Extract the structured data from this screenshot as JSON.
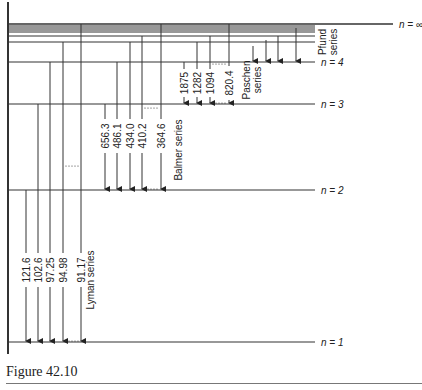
{
  "caption": "Figure 42.10",
  "colors": {
    "line": "#333333",
    "text": "#222222"
  },
  "axis": {
    "x": 8,
    "y_top": 2,
    "y_bottom": 354
  },
  "level_line_end_x": 315,
  "levels": [
    {
      "n": "1",
      "label": "n = 1",
      "y": 342,
      "labeled": true
    },
    {
      "n": "2",
      "label": "n = 2",
      "y": 190,
      "labeled": true
    },
    {
      "n": "3",
      "label": "n = 3",
      "y": 104,
      "labeled": true
    },
    {
      "n": "4",
      "label": "n = 4",
      "y": 62,
      "labeled": true
    },
    {
      "n": "5",
      "label": "",
      "y": 42,
      "labeled": false
    },
    {
      "n": "6",
      "label": "",
      "y": 36,
      "labeled": false
    },
    {
      "n": "7",
      "label": "",
      "y": 32,
      "labeled": false
    },
    {
      "n": "8",
      "label": "",
      "y": 30,
      "labeled": false
    },
    {
      "n": "9",
      "label": "",
      "y": 28,
      "labeled": false
    },
    {
      "n": "10",
      "label": "",
      "y": 26,
      "labeled": false
    },
    {
      "n": "∞",
      "label": "n = ∞",
      "y": 24,
      "labeled": true,
      "extends_to_x": 393
    }
  ],
  "series": [
    {
      "name": "Lyman series",
      "to_n": "1",
      "label": {
        "x": 90,
        "y": 280
      },
      "transitions": [
        {
          "from_n": "2",
          "x": 26,
          "wavelength": "121.6"
        },
        {
          "from_n": "3",
          "x": 38,
          "wavelength": "102.6"
        },
        {
          "from_n": "4",
          "x": 50,
          "wavelength": "97.25"
        },
        {
          "from_n": "5",
          "x": 63,
          "wavelength": "94.98"
        },
        {
          "from_n": "∞",
          "x": 81,
          "wavelength": "91.17"
        }
      ],
      "wavelength_label_y": 270,
      "dots_top_y": 166
    },
    {
      "name": "Balmer series",
      "to_n": "2",
      "label": {
        "x": 178,
        "y": 150
      },
      "transitions": [
        {
          "from_n": "3",
          "x": 105,
          "wavelength": "656.3"
        },
        {
          "from_n": "4",
          "x": 117,
          "wavelength": "486.1"
        },
        {
          "from_n": "5",
          "x": 130,
          "wavelength": "434.0"
        },
        {
          "from_n": "6",
          "x": 142,
          "wavelength": "410.2"
        },
        {
          "from_n": "∞",
          "x": 161,
          "wavelength": "364.6"
        }
      ],
      "wavelength_label_y": 136,
      "dots_top_y": 108
    },
    {
      "name": "Paschen series",
      "label_lines": [
        "Paschen",
        "series"
      ],
      "to_n": "3",
      "label": {
        "x": 246,
        "y": 80
      },
      "transitions": [
        {
          "from_n": "4",
          "x": 184,
          "wavelength": "1875"
        },
        {
          "from_n": "5",
          "x": 197,
          "wavelength": "1282"
        },
        {
          "from_n": "6",
          "x": 210,
          "wavelength": "1094"
        },
        {
          "from_n": "∞",
          "x": 229,
          "wavelength": "820.4"
        }
      ],
      "wavelength_label_y": 83,
      "dots_top_y": 64
    },
    {
      "name": "Pfund series",
      "label_lines": [
        "Pfund",
        "series"
      ],
      "to_n": "4",
      "label": {
        "x": 322,
        "y": 42
      },
      "transitions": [
        {
          "from_n": "5",
          "x": 253,
          "wavelength": ""
        },
        {
          "from_n": "6",
          "x": 266,
          "wavelength": ""
        },
        {
          "from_n": "7",
          "x": 278,
          "wavelength": ""
        },
        {
          "from_n": "∞",
          "x": 296,
          "wavelength": ""
        }
      ]
    }
  ]
}
